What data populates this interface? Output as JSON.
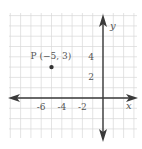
{
  "chart_data": {
    "type": "scatter",
    "title": "",
    "xlabel": "x",
    "ylabel": "y",
    "xlim": [
      -9,
      3
    ],
    "ylim": [
      -4,
      8
    ],
    "grid": true,
    "x_ticks": [
      {
        "value": -6,
        "label": "-6"
      },
      {
        "value": -4,
        "label": "-4"
      },
      {
        "value": -2,
        "label": "-2"
      }
    ],
    "y_ticks": [
      {
        "value": 4,
        "label": "4"
      },
      {
        "value": 2,
        "label": "2"
      }
    ],
    "points": [
      {
        "x": -5,
        "y": 3,
        "label": "P (−5, 3)"
      }
    ],
    "colors": {
      "axis": "#3a3a3a",
      "grid": "#d9d9d9",
      "point": "#333333",
      "text": "#555555"
    }
  }
}
